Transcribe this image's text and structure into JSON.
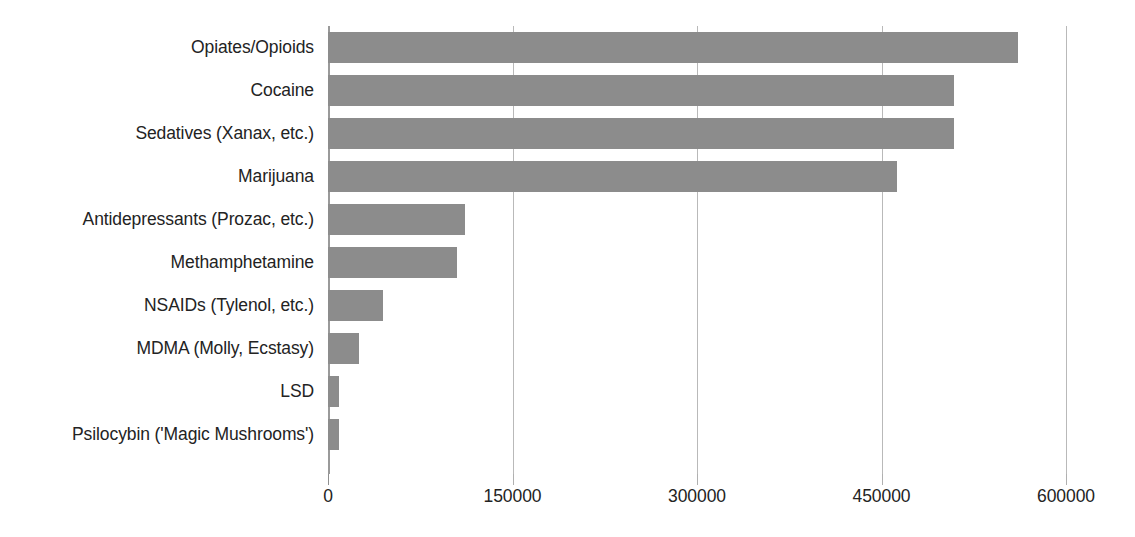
{
  "chart_data": {
    "type": "bar",
    "orientation": "horizontal",
    "title": "",
    "xlabel": "",
    "ylabel": "",
    "xlim": [
      0,
      600000
    ],
    "xticks": [
      0,
      150000,
      300000,
      450000,
      600000
    ],
    "xtick_labels": [
      "0",
      "150000",
      "300000",
      "450000",
      "600000"
    ],
    "grid": true,
    "grid_axis": "x",
    "legend": false,
    "bar_color": "#8c8c8c",
    "categories": [
      "Opiates/Opioids",
      "Cocaine",
      "Sedatives (Xanax, etc.)",
      "Marijuana",
      "Antidepressants (Prozac, etc.)",
      "Methamphetamine",
      "NSAIDs (Tylenol, etc.)",
      "MDMA (Molly, Ecstasy)",
      "LSD",
      "Psilocybin ('Magic Mushrooms')"
    ],
    "values": [
      561000,
      509000,
      509000,
      463000,
      111000,
      105000,
      45000,
      25000,
      9000,
      9000
    ]
  }
}
